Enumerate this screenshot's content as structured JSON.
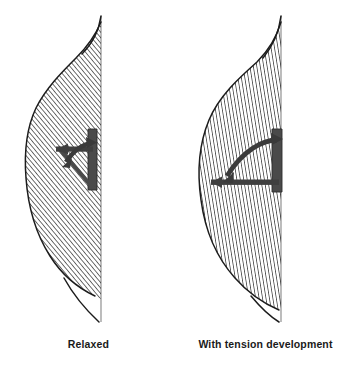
{
  "figure": {
    "type": "anatomical-line-diagram",
    "panels": [
      {
        "id": "relaxed",
        "caption": "Relaxed",
        "fiber_hatch_angle_deg": 38,
        "fiber_hatch_spacing_px": 2.6,
        "pennation_angle_deg": 32,
        "outline_color": "#1c1c1c",
        "fiber_color": "#2b2b2b",
        "aponeurosis_color": "#4a4a4a",
        "arrow_color": "#3a3a3a",
        "axis_line_color": "#8c8c8c",
        "axis_line_x": 101,
        "belly_max_width_px": 74,
        "angle_vertex": {
          "x": 92,
          "y": 186
        },
        "horizontal_arm": {
          "x1": 54,
          "y1": 150,
          "x2": 92,
          "y2": 150
        },
        "vertical_arm": {
          "x1": 92,
          "y1": 129,
          "x2": 92,
          "y2": 188
        }
      },
      {
        "id": "with-tension-development",
        "caption": "With tension development",
        "fiber_hatch_angle_deg": 12,
        "fiber_hatch_spacing_px": 2.6,
        "pennation_angle_deg": 58,
        "outline_color": "#1c1c1c",
        "fiber_color": "#2b2b2b",
        "aponeurosis_color": "#4a4a4a",
        "arrow_color": "#3a3a3a",
        "axis_line_color": "#8c8c8c",
        "axis_line_x": 104,
        "belly_max_width_px": 88,
        "angle_vertex": {
          "x": 104,
          "y": 190
        },
        "horizontal_arm": {
          "x1": 32,
          "y1": 182,
          "x2": 104,
          "y2": 182
        },
        "vertical_arm": {
          "x1": 104,
          "y1": 129,
          "x2": 104,
          "y2": 192
        }
      }
    ],
    "background_color": "#ffffff",
    "caption_color": "#1a1a1a"
  }
}
